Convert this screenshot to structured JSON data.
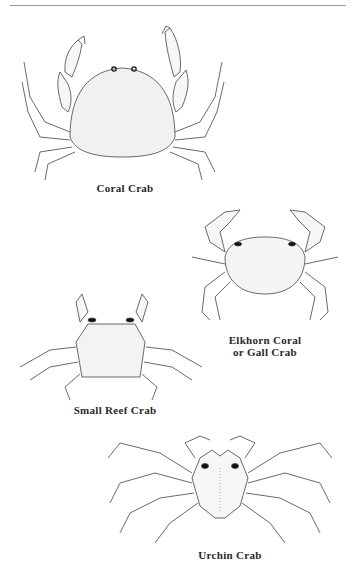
{
  "page": {
    "figures": [
      {
        "id": "coral-crab",
        "caption": "Coral Crab"
      },
      {
        "id": "elkhorn-coral-crab",
        "caption_line1": "Elkhorn Coral",
        "caption_line2": "or Gall Crab"
      },
      {
        "id": "small-reef-crab",
        "caption": "Small Reef Crab"
      },
      {
        "id": "urchin-crab",
        "caption": "Urchin Crab"
      }
    ]
  },
  "colors": {
    "ink": "#2a2a2a",
    "rule": "#9a9a9a",
    "background": "#ffffff"
  }
}
